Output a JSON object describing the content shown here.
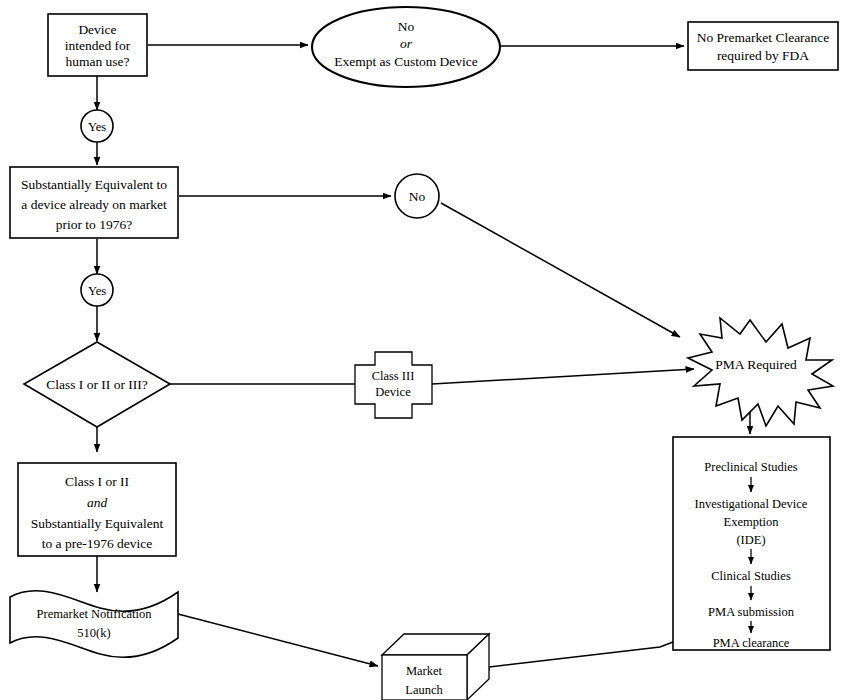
{
  "diagram": {
    "type": "flowchart",
    "line_color": "#000000",
    "fill_color": "#ffffff"
  },
  "nodes": {
    "device_intended": {
      "shape": "rectangle",
      "lines": [
        "Device",
        "intended for",
        "human use?"
      ]
    },
    "no_or_exempt": {
      "shape": "ellipse",
      "lines": [
        "No",
        "or",
        "Exempt as Custom Device"
      ],
      "italic_line_index": 1
    },
    "no_premarket": {
      "shape": "rectangle",
      "lines": [
        "No Premarket Clearance",
        "required by FDA"
      ]
    },
    "substantially_equivalent": {
      "shape": "rectangle",
      "lines": [
        "Substantially Equivalent to",
        "a device already on market",
        "prior to 1976?"
      ]
    },
    "class_question": {
      "shape": "diamond",
      "lines": [
        "Class I or II or III?"
      ]
    },
    "class_iii_device": {
      "shape": "cross",
      "lines": [
        "Class III",
        "Device"
      ]
    },
    "pma_required": {
      "shape": "starburst",
      "lines": [
        "PMA Required"
      ]
    },
    "class_i_or_ii": {
      "shape": "rectangle",
      "lines": [
        "Class I or II",
        "and",
        "Substantially Equivalent",
        "to a pre-1976 device"
      ],
      "italic_line_index": 1
    },
    "premarket_notification": {
      "shape": "wavy-document",
      "lines": [
        "Premarket Notification",
        "510(k)"
      ]
    },
    "pma_pathway": {
      "shape": "rectangle",
      "lines": [
        "Preclinical Studies",
        "Investigational Device",
        "Exemption",
        "(IDE)",
        "Clinical Studies",
        "PMA submission",
        "PMA clearance"
      ]
    },
    "market_launch": {
      "shape": "cube",
      "lines": [
        "Market",
        "Launch"
      ]
    }
  },
  "connector_labels": {
    "yes_1": "Yes",
    "yes_2": "Yes",
    "no_1": "No"
  }
}
